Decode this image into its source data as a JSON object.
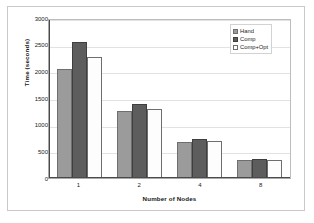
{
  "chart_data": {
    "type": "bar",
    "title": "",
    "xlabel": "Number of Nodes",
    "ylabel": "Time (seconds)",
    "categories": [
      "1",
      "2",
      "4",
      "8"
    ],
    "series": [
      {
        "name": "Hand",
        "values": [
          2050,
          1250,
          680,
          330
        ],
        "color": "#9b9b9b"
      },
      {
        "name": "Comp",
        "values": [
          2550,
          1390,
          740,
          350
        ],
        "color": "#5d5d5d"
      },
      {
        "name": "Comp+Opt",
        "values": [
          2260,
          1300,
          690,
          335
        ],
        "color": "#ffffff"
      }
    ],
    "ylim": [
      0,
      3000
    ],
    "ytick_values": [
      0,
      500,
      1000,
      1500,
      2000,
      2500,
      3000
    ],
    "ytick_labels": [
      "0",
      "500",
      "1000",
      "1500",
      "2000",
      "2500",
      "3000"
    ],
    "grid": true,
    "grid_axis": "y",
    "legend_position": "top-right",
    "legend_entries": [
      "Hand",
      "Comp",
      "Comp+Opt"
    ]
  },
  "figure": {
    "background_color": "#ffffff",
    "frame_color": "#c9c9c9",
    "axis_color": "#4a4a4a",
    "gridline_color": "#e2e2e2"
  }
}
